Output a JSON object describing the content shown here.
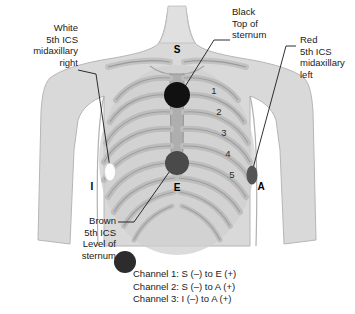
{
  "figure": {
    "colors": {
      "skin": "#d9d9d9",
      "torso_shade": "#cfcfcf",
      "ribcage": "#b4b4b4",
      "rib_outline": "#8f8f8f",
      "sternum": "#a8a8a8",
      "electrode_black": "#111111",
      "electrode_brown": "#4a4a4a",
      "electrode_red": "#555555",
      "electrode_white": "#fdfdfd",
      "leader_line": "#1a1a1a",
      "text": "#1a1a1a"
    }
  },
  "labels": {
    "white": {
      "lines": [
        "White",
        "5th ICS",
        "midaxillary",
        "right"
      ],
      "align": "right"
    },
    "black": {
      "lines": [
        "Black",
        "Top of",
        "sternum"
      ],
      "align": "left"
    },
    "red": {
      "lines": [
        "Red",
        "5th ICS",
        "midaxillary",
        "left"
      ],
      "align": "left"
    },
    "brown": {
      "lines": [
        "Brown",
        "5th ICS",
        "Level of",
        "sternum"
      ],
      "align": "right"
    }
  },
  "markers": {
    "s": "S",
    "e": "E",
    "i": "I",
    "a": "A"
  },
  "rib_numbers": [
    "1",
    "2",
    "3",
    "4",
    "5"
  ],
  "channels": [
    "Channel 1: S (–) to E (+)",
    "Channel 2: S (–) to A (+)",
    "Channel 3: I (–) to A (+)"
  ]
}
